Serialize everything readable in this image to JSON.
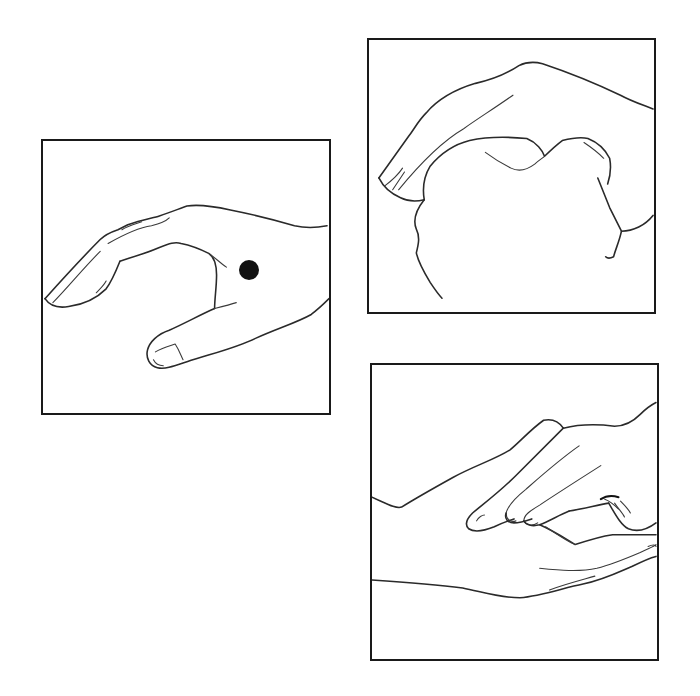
{
  "figure": {
    "panels": [
      {
        "id": "panel-1",
        "subject": "hand-side-view-with-acupressure-point",
        "marker": {
          "shape": "dot",
          "color": "#111111"
        }
      },
      {
        "id": "panel-2",
        "subject": "hand-cupping-fist"
      },
      {
        "id": "panel-3",
        "subject": "fingers-pressing-on-forearm-wrist"
      }
    ],
    "colors": {
      "background": "#ffffff",
      "line": "#2a2a2a",
      "frame": "#1a1a1a",
      "marker": "#111111"
    }
  }
}
